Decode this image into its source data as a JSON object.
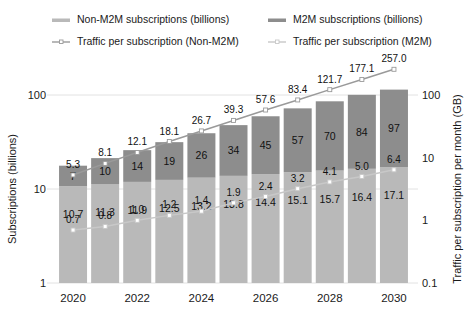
{
  "chart_data": {
    "type": "bar",
    "title": "",
    "subtitle": "",
    "categories": [
      "2020",
      "2021",
      "2022",
      "2023",
      "2024",
      "2025",
      "2026",
      "2027",
      "2028",
      "2029",
      "2030"
    ],
    "tick_labels": [
      "2020",
      "",
      "2022",
      "",
      "2024",
      "",
      "2026",
      "",
      "2028",
      "",
      "2030"
    ],
    "xlabel": "",
    "ylabel": "Subscriptions (billions)",
    "y2label": "Traffic per subscription per month (GB)",
    "yscale": "log",
    "ylim": [
      1,
      100
    ],
    "yticks": [
      "1",
      "10",
      "100"
    ],
    "y2lim": [
      0.1,
      100
    ],
    "y2ticks": [
      "0.1",
      "1",
      "10",
      "100"
    ],
    "grid": true,
    "legend_position": "top",
    "stacked": true,
    "series": [
      {
        "name": "Non-M2M subscriptions (billions)",
        "kind": "bar",
        "color": "#b9b9b9",
        "axis": "left",
        "values": [
          10.7,
          11.3,
          11.9,
          12.5,
          13.2,
          13.8,
          14.4,
          15.1,
          15.7,
          16.4,
          17.1
        ],
        "labels": [
          "10.7",
          "11.3",
          "11.9",
          "12.5",
          "13.2",
          "13.8",
          "14.4",
          "15.1",
          "15.7",
          "16.4",
          "17.1"
        ]
      },
      {
        "name": "M2M subscriptions (billions)",
        "kind": "bar",
        "color": "#8d8d8d",
        "axis": "left",
        "values": [
          7,
          10,
          14,
          19,
          26,
          34,
          45,
          57,
          70,
          84,
          97
        ],
        "labels": [
          "7",
          "10",
          "14",
          "19",
          "26",
          "34",
          "45",
          "57",
          "70",
          "84",
          "97"
        ]
      },
      {
        "name": "Traffic per subscription (Non-M2M)",
        "kind": "line",
        "color": "#9a9a9a",
        "marker": "square",
        "marker_color": "#ffffff",
        "axis": "right",
        "values": [
          5.3,
          8.1,
          12.1,
          18.1,
          26.7,
          39.3,
          57.6,
          83.4,
          121.7,
          177.1,
          257.0
        ],
        "labels": [
          "5.3",
          "8.1",
          "12.1",
          "18.1",
          "26.7",
          "39.3",
          "57.6",
          "83.4",
          "121.7",
          "177.1",
          "257.0"
        ]
      },
      {
        "name": "Traffic per subscription (M2M)",
        "kind": "line",
        "color": "#c8c8c8",
        "marker": "square",
        "marker_color": "#ffffff",
        "axis": "right",
        "values": [
          0.7,
          0.8,
          1.0,
          1.2,
          1.4,
          1.9,
          2.4,
          3.2,
          4.1,
          5.0,
          6.4
        ],
        "labels": [
          "0.7",
          "0.8",
          "1.0",
          "1.2",
          "1.4",
          "1.9",
          "2.4",
          "3.2",
          "4.1",
          "5.0",
          "6.4"
        ]
      }
    ]
  },
  "legend": {
    "items": [
      {
        "label": "Non-M2M subscriptions (billions)",
        "color": "#b9b9b9",
        "style": "bar"
      },
      {
        "label": "M2M subscriptions (billions)",
        "color": "#8d8d8d",
        "style": "bar"
      },
      {
        "label": "Traffic per subscription (Non-M2M)",
        "color": "#9a9a9a",
        "style": "line"
      },
      {
        "label": "Traffic per subscription (M2M)",
        "color": "#c8c8c8",
        "style": "line"
      }
    ]
  },
  "axes": {
    "left_title": "Subscriptions (billions)",
    "right_title": "Traffic per subscription per month (GB)",
    "left_ticks": [
      "100",
      "10",
      "1"
    ],
    "right_ticks": [
      "100",
      "10",
      "1",
      "0.1"
    ]
  }
}
